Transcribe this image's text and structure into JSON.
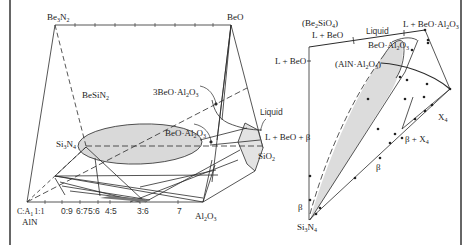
{
  "figure": {
    "left_diagram": {
      "name": "Be-Si-Al-O-N Jänecke prism/behavior diagram",
      "vertices": {
        "top_left": "Be3N2",
        "top_right": "BeO",
        "bottom_left_1": "C:A",
        "bottom_left_2": "AlN",
        "bottom_right": "Al2O3",
        "middle_left": "Si3N4",
        "middle_right": "SiO2"
      },
      "labels": {
        "be3n2": "Be",
        "be3n2_sub1": "3",
        "be3n2_n": "N",
        "be3n2_sub2": "2",
        "beo": "BeO",
        "besin2": "BeSiN",
        "besin2_sub": "2",
        "three_beo_al2o3": "3BeO·Al",
        "three_beo_al2o3_tail": "O",
        "beo_al2o3": "BeO·Al",
        "beo_al2o3_tail": "O",
        "liquid": "Liquid",
        "si3n4": "Si",
        "si3n4_n": "N",
        "sio2": "SiO",
        "al2o3": "Al",
        "al2o3_o": "O",
        "ca": "C:A",
        "ca_ratio": "1:1",
        "aln": "AlN",
        "gamma": "γ"
      },
      "bottom_ratios": [
        "0:9",
        "6:7",
        "5:6",
        "4:5",
        "3:6",
        "7"
      ]
    },
    "right_diagram": {
      "labels": {
        "be2sio4": "(Be",
        "be2sio4_tail": "SiO",
        "l_beo_top": "L + BeO",
        "liquid": "Liquid",
        "l_beo_al2o3": "L + BeO·Al",
        "l_beo_al2o3_tail": "O",
        "beo_al2o3": "BeO·Al",
        "beo_al2o3_tail": "O",
        "l_beo_side": "L + BeO",
        "aln_al2o3": "(AlN·Al",
        "aln_al2o3_tail": "O",
        "l_beo_beta": "L + BeO + β",
        "x4": "X",
        "beta_x4": "β + X",
        "beta_mid": "β",
        "beta_left": "β",
        "si3n4": "Si",
        "si3n4_n": "N"
      }
    },
    "colors": {
      "line": "#2b2b2b",
      "shade": "#d9d9d9",
      "frame": "#333333"
    }
  }
}
